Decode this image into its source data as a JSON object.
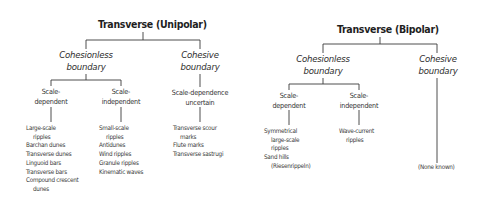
{
  "unipolar": {
    "title": "Transverse (Unipolar)",
    "cohesionless": {
      "label_line1": "Cohesionless",
      "label_line2": "boundary",
      "scale_dependent": {
        "label_line1": "Scale-",
        "label_line2": "dependent",
        "items": [
          {
            "text": "Large-scale",
            "indent": false
          },
          {
            "text": "ripples",
            "indent": true
          },
          {
            "text": "Barchan dunes",
            "indent": false
          },
          {
            "text": "Transverse dunes",
            "indent": false
          },
          {
            "text": "Linguoid bars",
            "indent": false
          },
          {
            "text": "Transverse bars",
            "indent": false
          },
          {
            "text": "Compound crescent",
            "indent": false
          },
          {
            "text": "dunes",
            "indent": true
          }
        ]
      },
      "scale_independent": {
        "label_line1": "Scale-",
        "label_line2": "independent",
        "items": [
          {
            "text": "Small-scale",
            "indent": false
          },
          {
            "text": "ripples",
            "indent": true
          },
          {
            "text": "Antidunes",
            "indent": false
          },
          {
            "text": "Wind ripples",
            "indent": false
          },
          {
            "text": "Granule ripples",
            "indent": false
          },
          {
            "text": "Kinematic waves",
            "indent": false
          }
        ]
      }
    },
    "cohesive": {
      "label_line1": "Cohesive",
      "label_line2": "boundary",
      "scale_uncertain": {
        "label_line1": "Scale-dependence",
        "label_line2": "uncertain",
        "items": [
          {
            "text": "Transverse scour",
            "indent": false
          },
          {
            "text": "marks",
            "indent": true
          },
          {
            "text": "Flute marks",
            "indent": false
          },
          {
            "text": "Transverse sastrugi",
            "indent": false
          }
        ]
      }
    }
  },
  "bipolar": {
    "title": "Transverse (Bipolar)",
    "cohesionless": {
      "label_line1": "Cohesionless",
      "label_line2": "boundary",
      "scale_dependent": {
        "label_line1": "Scale-",
        "label_line2": "dependent",
        "items": [
          {
            "text": "Symmetrical",
            "indent": false
          },
          {
            "text": "large-scale",
            "indent": true
          },
          {
            "text": "ripples",
            "indent": true
          },
          {
            "text": "Sand hills",
            "indent": false
          },
          {
            "text": "(Riesenrippeln)",
            "indent": true
          }
        ]
      },
      "scale_independent": {
        "label_line1": "Scale-",
        "label_line2": "independent",
        "items": [
          {
            "text": "Wave-current",
            "indent": false
          },
          {
            "text": "ripples",
            "indent": true
          }
        ]
      }
    },
    "cohesive": {
      "label_line1": "Cohesive",
      "label_line2": "boundary",
      "items": [
        {
          "text": "(None known)",
          "indent": false
        }
      ]
    }
  }
}
